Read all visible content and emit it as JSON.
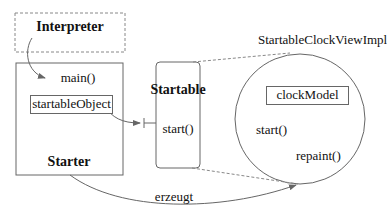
{
  "diagram": {
    "nodes": {
      "interpreter": {
        "label": "Interpreter",
        "style": "dashed-box"
      },
      "starter": {
        "label": "Starter",
        "method": "main()",
        "field": "startableObject"
      },
      "startable": {
        "label": "Startable",
        "method": "start()",
        "style": "rounded-box"
      },
      "impl": {
        "title": "StartableClockViewImpl",
        "field": "clockModel",
        "methods": [
          "start()",
          "repaint()"
        ],
        "style": "circle"
      }
    },
    "edges": [
      {
        "from": "interpreter",
        "to": "starter.main",
        "style": "curved-arrow"
      },
      {
        "from": "starter.startableObject",
        "to": "startable",
        "style": "interface-reference"
      },
      {
        "from": "starter",
        "to": "impl",
        "label": "erzeugt",
        "style": "curved-arrow"
      },
      {
        "from": "startable",
        "to": "impl",
        "style": "dashed-zoom-lines"
      }
    ],
    "colors": {
      "line": "#666666",
      "text": "#111111",
      "background": "#ffffff"
    }
  }
}
